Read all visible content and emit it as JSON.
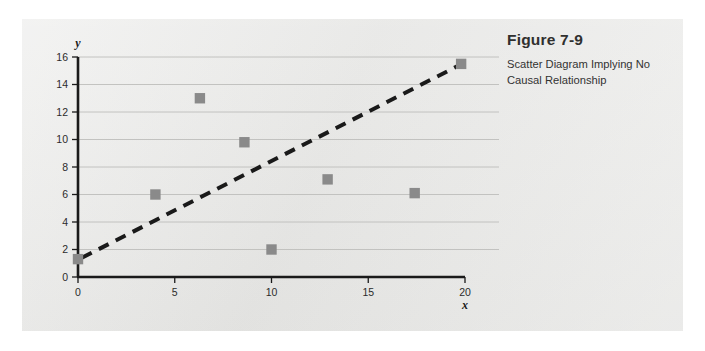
{
  "figure": {
    "number": "Figure 7-9",
    "caption": "Scatter Diagram Implying No Causal Relationship"
  },
  "colors": {
    "panel_background": "#e8e8e6",
    "marker": "#8a8a8a",
    "axis": "#1a1a1a",
    "gridline": "#bdbdbb",
    "trendline": "#1a1a1a",
    "text": "#2b2b2b"
  },
  "chart_data": {
    "type": "scatter",
    "title": "Scatter Diagram Implying No Causal Relationship",
    "xlabel": "x",
    "ylabel": "y",
    "xlim": [
      0,
      20
    ],
    "ylim": [
      0,
      16
    ],
    "xticks": [
      0,
      5,
      10,
      15,
      20
    ],
    "yticks": [
      0,
      2,
      4,
      6,
      8,
      10,
      12,
      14,
      16
    ],
    "xtick_labels": [
      "0",
      "5",
      "10",
      "15",
      "20"
    ],
    "ytick_labels": [
      "0",
      "2",
      "4",
      "6",
      "8",
      "10",
      "12",
      "14",
      "16"
    ],
    "grid": "horizontal",
    "legend": "none",
    "series": [
      {
        "name": "observations",
        "marker": "square",
        "color": "#8a8a8a",
        "points": [
          {
            "x": 0.0,
            "y": 1.3
          },
          {
            "x": 4.0,
            "y": 6.0
          },
          {
            "x": 6.3,
            "y": 13.0
          },
          {
            "x": 8.6,
            "y": 9.8
          },
          {
            "x": 10.0,
            "y": 2.0
          },
          {
            "x": 12.9,
            "y": 7.1
          },
          {
            "x": 17.4,
            "y": 6.1
          },
          {
            "x": 19.8,
            "y": 15.5
          }
        ]
      },
      {
        "name": "trend-line",
        "marker": "none",
        "style": "dashed",
        "color": "#1a1a1a",
        "points": [
          {
            "x": 0.2,
            "y": 1.4
          },
          {
            "x": 19.7,
            "y": 15.4
          }
        ]
      }
    ]
  }
}
